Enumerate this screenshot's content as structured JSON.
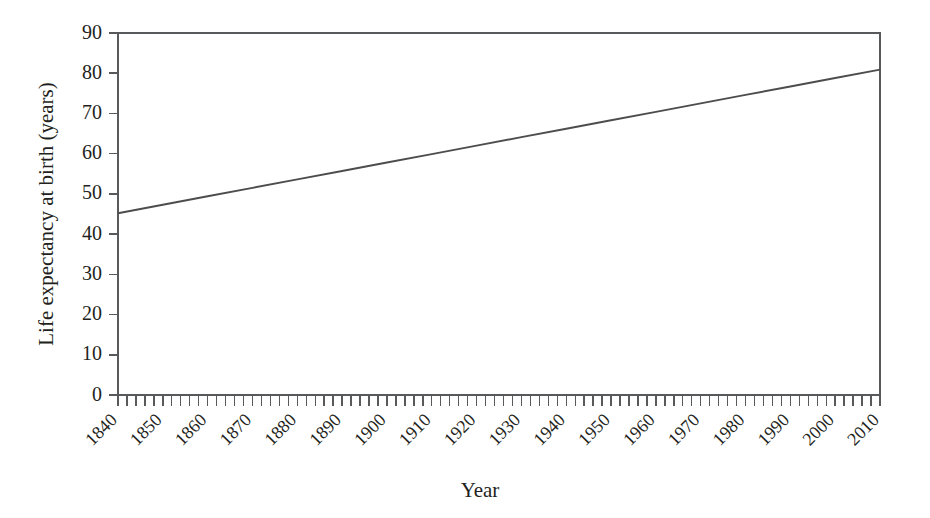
{
  "chart_data": {
    "type": "line",
    "title": "",
    "xlabel": "Year",
    "ylabel": "Life expectancy at birth (years)",
    "xlim": [
      1840,
      2010
    ],
    "ylim": [
      0,
      90
    ],
    "grid": false,
    "legend": null,
    "x_tick_labels": [
      "1840",
      "1850",
      "1860",
      "1870",
      "1880",
      "1890",
      "1900",
      "1910",
      "1920",
      "1930",
      "1940",
      "1950",
      "1960",
      "1970",
      "1980",
      "1990",
      "2000",
      "2010"
    ],
    "x_tick_values": [
      1840,
      1850,
      1860,
      1870,
      1880,
      1890,
      1900,
      1910,
      1920,
      1930,
      1940,
      1950,
      1960,
      1970,
      1980,
      1990,
      2000,
      2010
    ],
    "y_tick_labels": [
      "0",
      "10",
      "20",
      "30",
      "40",
      "50",
      "60",
      "70",
      "80",
      "90"
    ],
    "y_tick_values": [
      0,
      10,
      20,
      30,
      40,
      50,
      60,
      70,
      80,
      90
    ],
    "x_minor_tick_step": 2,
    "series": [
      {
        "name": "Life expectancy at birth",
        "color": "#4d4d4f",
        "x": [
          1840,
          1850,
          1860,
          1870,
          1880,
          1890,
          1900,
          1910,
          1920,
          1930,
          1940,
          1950,
          1960,
          1970,
          1980,
          1990,
          2000,
          2010
        ],
        "values": [
          45.2,
          47.3,
          49.4,
          51.5,
          53.6,
          55.7,
          57.8,
          59.9,
          62.0,
          64.1,
          66.2,
          68.3,
          70.4,
          72.5,
          74.6,
          76.7,
          78.8,
          80.9
        ]
      }
    ]
  },
  "axes": {
    "x_title": "Year",
    "y_title": "Life expectancy at birth (years)"
  }
}
